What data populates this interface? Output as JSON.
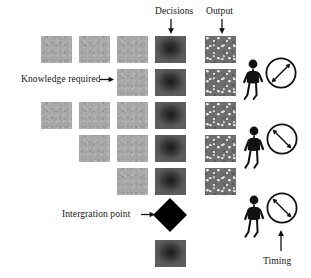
{
  "figure": {
    "type": "diagram",
    "background_color": "#ffffff",
    "colors": {
      "knowledge_square": "#a6a6a6",
      "decision_square": "#2c2c2c",
      "output_square": "#6e6e6e",
      "integration_point": "#000000",
      "text": "#141414"
    }
  },
  "labels": {
    "decisions": "Decisions",
    "output": "Output",
    "knowledge_required": "Knowledge required",
    "integration_point": "Intergration point",
    "timing": "Timing"
  },
  "columns": [
    {
      "name": "knowledge-1",
      "kind": "knowledge"
    },
    {
      "name": "knowledge-2",
      "kind": "knowledge"
    },
    {
      "name": "knowledge-3",
      "kind": "knowledge"
    },
    {
      "name": "decisions",
      "kind": "decision"
    },
    {
      "name": "output",
      "kind": "output"
    }
  ],
  "rows": [
    {
      "index": 1,
      "knowledge_cells": [
        1,
        2,
        3
      ],
      "decision": true,
      "output": true
    },
    {
      "index": 2,
      "knowledge_cells": [
        3
      ],
      "decision": true,
      "output": true
    },
    {
      "index": 3,
      "knowledge_cells": [
        1,
        2,
        3
      ],
      "decision": true,
      "output": true
    },
    {
      "index": 4,
      "knowledge_cells": [
        2,
        3
      ],
      "decision": true,
      "output": true
    },
    {
      "index": 5,
      "knowledge_cells": [
        3
      ],
      "decision": true,
      "output": true
    }
  ],
  "integration": {
    "shape": "diamond",
    "final_decision_square": true
  },
  "actors": [
    {
      "id": 1,
      "icon": "stick-figure-with-clock",
      "clock_hand": "upper-right-to-lower-left"
    },
    {
      "id": 2,
      "icon": "stick-figure-with-clock",
      "clock_hand": "upper-left-to-lower-right"
    },
    {
      "id": 3,
      "icon": "stick-figure-with-clock",
      "clock_hand": "upper-left-to-lower-right"
    }
  ],
  "annotations": [
    {
      "name": "decisions-arrow",
      "direction": "down"
    },
    {
      "name": "output-arrow",
      "direction": "down"
    },
    {
      "name": "knowledge-arrow",
      "direction": "right"
    },
    {
      "name": "integration-arrow",
      "direction": "right"
    },
    {
      "name": "timing-arrow",
      "direction": "up"
    }
  ]
}
